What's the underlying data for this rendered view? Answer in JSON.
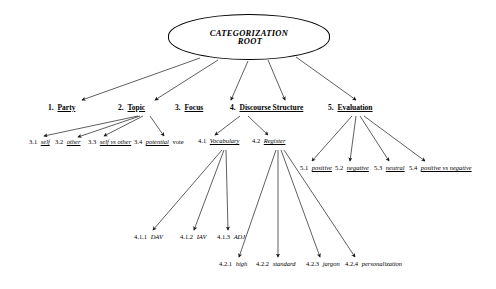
{
  "diagram": {
    "root": {
      "line1": "CATEGORIZATION",
      "line2": "ROOT"
    },
    "level2": [
      {
        "id": "n1",
        "num": "1.",
        "label": "Party"
      },
      {
        "id": "n2",
        "num": "2.",
        "label": "Topic"
      },
      {
        "id": "n3",
        "num": "3.",
        "label": "Focus"
      },
      {
        "id": "n4",
        "num": "4.",
        "label": "Discourse Structure"
      },
      {
        "id": "n5",
        "num": "5.",
        "label": "Evaluation"
      }
    ],
    "focus_children": [
      {
        "num": "3.1",
        "label": "self",
        "tail": ""
      },
      {
        "num": "3.2",
        "label": "other",
        "tail": ""
      },
      {
        "num": "3.3",
        "label": "self vs other",
        "tail": ""
      },
      {
        "num": "3.4",
        "label": "potential",
        "tail": "vote"
      }
    ],
    "discourse_children": [
      {
        "num": "4.1",
        "label": "Vocabulary"
      },
      {
        "num": "4.2",
        "label": "Register"
      }
    ],
    "evaluation_children": [
      {
        "num": "5.1",
        "label": "positive"
      },
      {
        "num": "5.2",
        "label": "negative"
      },
      {
        "num": "5.3",
        "label": "neutral"
      },
      {
        "num": "5.4",
        "label": "positive vs negative"
      }
    ],
    "vocabulary_children": [
      {
        "num": "4.1.1",
        "label": "DAV"
      },
      {
        "num": "4.1.2",
        "label": "IAV"
      },
      {
        "num": "4.1.3",
        "label": "ADJ"
      }
    ],
    "register_children": [
      {
        "num": "4.2.1",
        "label": "high"
      },
      {
        "num": "4.2.2",
        "label": "standard"
      },
      {
        "num": "4.2.3",
        "label": "jargon"
      },
      {
        "num": "4.2.4",
        "label": "personalization"
      }
    ],
    "colors": {
      "stroke": "#1a1a1a",
      "background": "#ffffff",
      "text": "#000000"
    }
  }
}
